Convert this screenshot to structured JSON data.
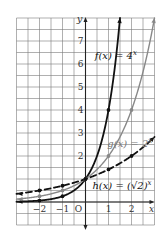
{
  "chart_data": {
    "type": "line",
    "title": "",
    "xlabel": "x",
    "ylabel": "y",
    "xlim": [
      -3,
      3
    ],
    "ylim": [
      -1,
      8
    ],
    "grid": true,
    "grid_step": 0.5,
    "x_ticks": [
      {
        "value": -2,
        "label": "−2"
      },
      {
        "value": -1,
        "label": "−1"
      },
      {
        "value": 0,
        "label": "O"
      },
      {
        "value": 1,
        "label": "1"
      },
      {
        "value": 2,
        "label": "2"
      }
    ],
    "y_ticks": [
      {
        "value": 2,
        "label": "2"
      },
      {
        "value": 3,
        "label": "3"
      },
      {
        "value": 4,
        "label": "4"
      },
      {
        "value": 5,
        "label": "5"
      },
      {
        "value": 6,
        "label": "6"
      },
      {
        "value": 7,
        "label": "7"
      }
    ],
    "series": [
      {
        "name": "f(x) = 4^x",
        "base": 4,
        "style": "solid",
        "color": "#111111",
        "width": 1.8,
        "label": {
          "text": "f(x) = 4",
          "sup": "x",
          "x": 0.4,
          "y": 6.2
        },
        "points": [
          [
            -2,
            0.0625
          ],
          [
            -1,
            0.25
          ],
          [
            0,
            1
          ],
          [
            1,
            4
          ]
        ]
      },
      {
        "name": "g(x) = 2^x",
        "base": 2,
        "style": "solid",
        "color": "#888888",
        "width": 1.4,
        "label": {
          "text": "g(x) = 2",
          "sup": "x",
          "x": 0.95,
          "y": 2.4
        },
        "points": [
          [
            -2,
            0.25
          ],
          [
            -1,
            0.5
          ],
          [
            0,
            1
          ],
          [
            1,
            2
          ],
          [
            2,
            4
          ]
        ]
      },
      {
        "name": "h(x) = (√2)^x",
        "base": 1.41421356,
        "style": "dashed",
        "color": "#111111",
        "width": 1.8,
        "label": {
          "text": "h(x) = (√2)",
          "sup": "x",
          "x": 0.3,
          "y": 0.55
        },
        "points": [
          [
            -2,
            0.5
          ],
          [
            -1,
            0.7071
          ],
          [
            0,
            1
          ],
          [
            1,
            1.4142
          ],
          [
            2,
            2
          ]
        ]
      }
    ]
  }
}
